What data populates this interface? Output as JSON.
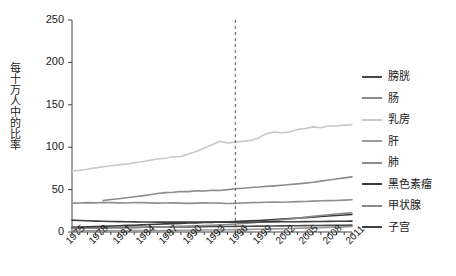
{
  "chart_data": {
    "type": "line",
    "title": "",
    "xlabel": "",
    "ylabel": "每十万人中的比率",
    "xlim": [
      1975,
      2011
    ],
    "ylim": [
      0,
      250
    ],
    "grid": false,
    "legend_position": "right",
    "x_tick_labels": [
      "1975",
      "1978",
      "1981",
      "1984",
      "1987",
      "1990",
      "1993",
      "1996",
      "1999",
      "2002",
      "2005",
      "2008",
      "2011"
    ],
    "x_tick_values": [
      1975,
      1978,
      1981,
      1984,
      1987,
      1990,
      1993,
      1996,
      1999,
      2002,
      2005,
      2008,
      2011
    ],
    "y_tick_labels": [
      "0",
      "50",
      "100",
      "150",
      "200",
      "250"
    ],
    "y_tick_values": [
      0,
      50,
      100,
      150,
      200,
      250
    ],
    "annotations": [
      {
        "name": "reference-line",
        "type": "vline",
        "x": 1996,
        "style": "dashed",
        "color": "#555555"
      }
    ],
    "x": [
      1975,
      1976,
      1977,
      1978,
      1979,
      1980,
      1981,
      1982,
      1983,
      1984,
      1985,
      1986,
      1987,
      1988,
      1989,
      1990,
      1991,
      1992,
      1993,
      1994,
      1995,
      1996,
      1997,
      1998,
      1999,
      2000,
      2001,
      2002,
      2003,
      2004,
      2005,
      2006,
      2007,
      2008,
      2009,
      2010,
      2011
    ],
    "series": [
      {
        "name": "膀胱",
        "color": "#4a4a4a",
        "values": [
          4.8,
          4.9,
          5.0,
          5.1,
          5.2,
          5.3,
          5.3,
          5.4,
          5.5,
          5.6,
          5.7,
          5.8,
          5.9,
          6.0,
          6.1,
          6.1,
          6.2,
          6.3,
          6.4,
          6.4,
          6.5,
          6.6,
          6.7,
          6.8,
          6.9,
          7.0,
          7.1,
          7.2,
          7.3,
          7.4,
          7.5,
          7.6,
          7.7,
          7.8,
          7.9,
          8.0,
          8.1
        ]
      },
      {
        "name": "肠",
        "color": "#8c8c8c",
        "values": [
          null,
          null,
          null,
          null,
          37.0,
          38.4,
          39.2,
          40.4,
          41.6,
          42.6,
          44.0,
          45.4,
          46.4,
          46.8,
          47.8,
          47.6,
          48.6,
          48.4,
          49.2,
          49.0,
          50.0,
          51.0,
          51.6,
          52.4,
          53.0,
          53.8,
          54.4,
          55.2,
          56.0,
          56.8,
          57.6,
          58.6,
          60.0,
          61.4,
          62.6,
          63.8,
          65.0
        ]
      },
      {
        "name": "乳房",
        "color": "#c8c8c8",
        "values": [
          72.0,
          72.8,
          74.0,
          75.6,
          77.0,
          78.2,
          79.4,
          80.0,
          81.6,
          82.8,
          84.6,
          86.0,
          87.0,
          88.8,
          89.0,
          92.0,
          95.0,
          99.0,
          103.0,
          107.0,
          105.0,
          106.0,
          107.0,
          108.0,
          111.0,
          116.0,
          118.0,
          117.0,
          118.0,
          121.0,
          122.0,
          124.0,
          123.0,
          125.0,
          125.0,
          126.0,
          126.5
        ]
      },
      {
        "name": "肝",
        "color": "#9a9a9a",
        "values": [
          1.2,
          1.2,
          1.3,
          1.3,
          1.4,
          1.4,
          1.5,
          1.5,
          1.6,
          1.6,
          1.7,
          1.8,
          1.8,
          1.9,
          2.0,
          2.1,
          2.2,
          2.3,
          2.4,
          2.5,
          2.6,
          2.8,
          2.9,
          3.1,
          3.3,
          3.5,
          3.7,
          3.9,
          4.1,
          4.4,
          4.6,
          4.9,
          5.2,
          5.5,
          5.8,
          6.1,
          6.4
        ]
      },
      {
        "name": "肺",
        "color": "#8f8f8f",
        "values": [
          34.0,
          34.2,
          34.6,
          34.4,
          34.8,
          34.6,
          34.4,
          34.2,
          34.8,
          34.6,
          34.4,
          34.0,
          34.2,
          34.4,
          34.0,
          33.8,
          34.0,
          34.4,
          34.2,
          34.0,
          33.6,
          33.8,
          34.2,
          34.6,
          34.8,
          35.0,
          35.2,
          35.0,
          35.4,
          35.8,
          36.0,
          36.4,
          36.8,
          37.0,
          37.2,
          37.6,
          38.0
        ]
      },
      {
        "name": "黑色素瘤",
        "color": "#3a3a3a",
        "values": [
          5.6,
          5.8,
          6.0,
          6.3,
          6.6,
          7.0,
          7.4,
          7.8,
          8.0,
          8.4,
          8.8,
          9.2,
          9.6,
          9.8,
          10.2,
          10.6,
          10.8,
          11.2,
          11.4,
          11.8,
          12.0,
          12.4,
          12.8,
          13.2,
          13.6,
          14.0,
          14.6,
          15.2,
          15.8,
          16.4,
          17.0,
          17.6,
          18.2,
          18.8,
          19.4,
          20.0,
          20.6
        ]
      },
      {
        "name": "甲状腺",
        "color": "#8a8a8a",
        "values": [
          4.2,
          4.3,
          4.4,
          4.5,
          4.6,
          4.7,
          4.8,
          5.0,
          5.2,
          5.4,
          5.6,
          5.8,
          6.0,
          6.3,
          6.6,
          6.9,
          7.2,
          7.6,
          8.0,
          8.4,
          8.8,
          9.4,
          10.0,
          10.8,
          11.6,
          12.4,
          13.4,
          14.4,
          15.4,
          16.4,
          17.4,
          18.4,
          19.4,
          20.4,
          21.2,
          22.0,
          22.6
        ]
      },
      {
        "name": "子宫",
        "color": "#3f3f3f",
        "values": [
          14.0,
          13.6,
          13.2,
          12.8,
          12.6,
          12.4,
          12.2,
          12.0,
          11.9,
          11.8,
          11.8,
          11.7,
          11.7,
          11.6,
          11.6,
          11.6,
          11.6,
          11.6,
          11.6,
          11.6,
          11.6,
          11.7,
          11.7,
          11.8,
          11.8,
          11.9,
          11.9,
          12.0,
          12.0,
          12.1,
          12.2,
          12.3,
          12.4,
          12.5,
          12.6,
          12.7,
          12.8
        ]
      }
    ]
  },
  "axes": {
    "y_axis_label": "每十万人中的比率"
  }
}
